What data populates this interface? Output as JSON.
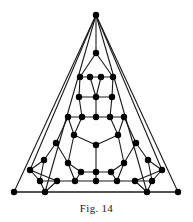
{
  "figure": {
    "caption": "Fig. 14",
    "type": "graph-diagram",
    "style": {
      "background": "#ffffff",
      "edge_color": "#1a1a1a",
      "vertex_color": "#000000",
      "edge_width": 1.1,
      "vertex_radius": 3.2,
      "width": 193,
      "height": 222
    }
  },
  "chart_data": {
    "type": "diagram",
    "title": "Fig. 14",
    "xlabel": "",
    "ylabel": "",
    "nodes": [
      {
        "id": 0,
        "label": "apex",
        "x": 96,
        "y": 15
      },
      {
        "id": 1,
        "label": "apex-inner",
        "x": 96,
        "y": 53
      },
      {
        "id": 2,
        "label": "r2-a",
        "x": 80,
        "y": 77
      },
      {
        "id": 3,
        "label": "r2-b",
        "x": 90,
        "y": 77
      },
      {
        "id": 4,
        "label": "r2-c",
        "x": 101,
        "y": 77
      },
      {
        "id": 5,
        "label": "r2-d",
        "x": 113,
        "y": 77
      },
      {
        "id": 6,
        "label": "r3-a",
        "x": 79,
        "y": 97
      },
      {
        "id": 7,
        "label": "r3-b",
        "x": 96,
        "y": 97
      },
      {
        "id": 8,
        "label": "r3-c",
        "x": 112,
        "y": 97
      },
      {
        "id": 9,
        "label": "r4-a",
        "x": 68,
        "y": 117
      },
      {
        "id": 10,
        "label": "r4-b",
        "x": 82,
        "y": 117
      },
      {
        "id": 11,
        "label": "r4-c",
        "x": 96,
        "y": 117
      },
      {
        "id": 12,
        "label": "r4-d",
        "x": 110,
        "y": 117
      },
      {
        "id": 13,
        "label": "r4-e",
        "x": 124,
        "y": 117
      },
      {
        "id": 14,
        "label": "pent-ul",
        "x": 74,
        "y": 135
      },
      {
        "id": 15,
        "label": "pent-ur",
        "x": 118,
        "y": 135
      },
      {
        "id": 16,
        "label": "hub",
        "x": 96,
        "y": 145
      },
      {
        "id": 17,
        "label": "l-out-1",
        "x": 56,
        "y": 143
      },
      {
        "id": 18,
        "label": "r-out-1",
        "x": 136,
        "y": 143
      },
      {
        "id": 19,
        "label": "l-out-2",
        "x": 44,
        "y": 160
      },
      {
        "id": 20,
        "label": "r-out-2",
        "x": 148,
        "y": 160
      },
      {
        "id": 21,
        "label": "pent-l",
        "x": 68,
        "y": 163
      },
      {
        "id": 22,
        "label": "pent-r",
        "x": 124,
        "y": 163
      },
      {
        "id": 23,
        "label": "b-row-a",
        "x": 81,
        "y": 172
      },
      {
        "id": 24,
        "label": "b-row-b",
        "x": 96,
        "y": 172
      },
      {
        "id": 25,
        "label": "b-row-c",
        "x": 111,
        "y": 172
      },
      {
        "id": 26,
        "label": "l-corner-u",
        "x": 30,
        "y": 170
      },
      {
        "id": 27,
        "label": "r-corner-u",
        "x": 162,
        "y": 170
      },
      {
        "id": 28,
        "label": "l-corner-m",
        "x": 40,
        "y": 181
      },
      {
        "id": 29,
        "label": "r-corner-m",
        "x": 152,
        "y": 181
      },
      {
        "id": 30,
        "label": "b2-a",
        "x": 57,
        "y": 181
      },
      {
        "id": 31,
        "label": "b2-b",
        "x": 75,
        "y": 181
      },
      {
        "id": 32,
        "label": "b2-c",
        "x": 96,
        "y": 181
      },
      {
        "id": 33,
        "label": "b2-d",
        "x": 117,
        "y": 181
      },
      {
        "id": 34,
        "label": "b2-e",
        "x": 135,
        "y": 181
      },
      {
        "id": 35,
        "label": "b3-l",
        "x": 45,
        "y": 192
      },
      {
        "id": 36,
        "label": "b3-r",
        "x": 147,
        "y": 192
      },
      {
        "id": 37,
        "label": "bl-corner",
        "x": 14,
        "y": 192
      },
      {
        "id": 38,
        "label": "br-corner",
        "x": 178,
        "y": 192
      }
    ],
    "edges": [
      [
        0,
        1
      ],
      [
        0,
        37
      ],
      [
        0,
        38
      ],
      [
        1,
        2
      ],
      [
        1,
        5
      ],
      [
        2,
        3
      ],
      [
        3,
        4
      ],
      [
        4,
        5
      ],
      [
        2,
        6
      ],
      [
        5,
        8
      ],
      [
        3,
        7
      ],
      [
        4,
        7
      ],
      [
        6,
        7
      ],
      [
        7,
        8
      ],
      [
        6,
        10
      ],
      [
        8,
        12
      ],
      [
        7,
        11
      ],
      [
        9,
        10
      ],
      [
        10,
        11
      ],
      [
        11,
        12
      ],
      [
        12,
        13
      ],
      [
        9,
        14
      ],
      [
        13,
        15
      ],
      [
        10,
        14
      ],
      [
        12,
        15
      ],
      [
        14,
        16
      ],
      [
        15,
        16
      ],
      [
        16,
        24
      ],
      [
        14,
        21
      ],
      [
        15,
        22
      ],
      [
        9,
        17
      ],
      [
        13,
        18
      ],
      [
        17,
        19
      ],
      [
        18,
        20
      ],
      [
        17,
        21
      ],
      [
        18,
        22
      ],
      [
        19,
        28
      ],
      [
        20,
        29
      ],
      [
        19,
        26
      ],
      [
        20,
        27
      ],
      [
        21,
        23
      ],
      [
        22,
        25
      ],
      [
        23,
        24
      ],
      [
        24,
        25
      ],
      [
        21,
        31
      ],
      [
        22,
        33
      ],
      [
        23,
        31
      ],
      [
        25,
        33
      ],
      [
        24,
        32
      ],
      [
        26,
        28
      ],
      [
        27,
        29
      ],
      [
        28,
        30
      ],
      [
        29,
        34
      ],
      [
        26,
        30
      ],
      [
        27,
        34
      ],
      [
        30,
        31
      ],
      [
        31,
        32
      ],
      [
        32,
        33
      ],
      [
        33,
        34
      ],
      [
        30,
        35
      ],
      [
        34,
        36
      ],
      [
        28,
        35
      ],
      [
        29,
        36
      ],
      [
        35,
        36
      ],
      [
        35,
        37
      ],
      [
        36,
        38
      ],
      [
        37,
        38
      ],
      [
        0,
        35
      ],
      [
        0,
        36
      ],
      [
        0,
        26
      ],
      [
        0,
        27
      ]
    ],
    "counts": {
      "nodes": 39,
      "edges": 72
    }
  }
}
